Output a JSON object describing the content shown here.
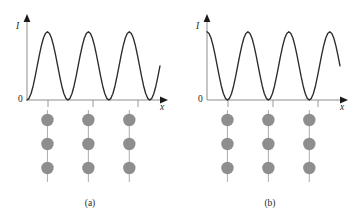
{
  "figure": {
    "caption_a": "(a)",
    "caption_b": "(b)",
    "background_color": "#ffffff",
    "curve_color": "#2b2b2b",
    "axis_color": "#8d8d8d",
    "dot_color": "#8e8e8e",
    "lattice_line_color": "#b3b3b3"
  },
  "chart_data": [
    {
      "type": "line",
      "panel": "a",
      "title": "(a)",
      "xlabel": "x",
      "ylabel": "I",
      "origin_label": "0",
      "grid": false,
      "legend": "none",
      "xlim": [
        0,
        3.25
      ],
      "ylim": [
        0,
        1.1
      ],
      "axis_tick_labels": [],
      "tick_positions_x": [
        0.5,
        1.5,
        2.5
      ],
      "description": "Intensity varies as sin-squared: zero at the atomic planes, maxima midway between them.",
      "x": [
        0,
        0.05,
        0.1,
        0.15,
        0.2,
        0.25,
        0.3,
        0.35,
        0.4,
        0.45,
        0.5,
        0.55,
        0.6,
        0.65,
        0.7,
        0.75,
        0.8,
        0.85,
        0.9,
        0.95,
        1.0,
        1.05,
        1.1,
        1.15,
        1.2,
        1.25,
        1.3,
        1.35,
        1.4,
        1.45,
        1.5,
        1.55,
        1.6,
        1.65,
        1.7,
        1.75,
        1.8,
        1.85,
        1.9,
        1.95,
        2.0,
        2.05,
        2.1,
        2.15,
        2.2,
        2.25,
        2.3,
        2.35,
        2.4,
        2.45,
        2.5,
        2.55,
        2.6,
        2.65,
        2.7,
        2.75,
        2.8,
        2.85,
        2.9,
        2.95,
        3.0,
        3.05,
        3.1,
        3.15,
        3.2,
        3.25
      ],
      "y": [
        0.0,
        0.024,
        0.095,
        0.206,
        0.345,
        0.5,
        0.655,
        0.794,
        0.905,
        0.976,
        1.0,
        0.976,
        0.905,
        0.794,
        0.655,
        0.5,
        0.345,
        0.206,
        0.095,
        0.024,
        0.0,
        0.024,
        0.095,
        0.206,
        0.345,
        0.5,
        0.655,
        0.794,
        0.905,
        0.976,
        1.0,
        0.976,
        0.905,
        0.794,
        0.655,
        0.5,
        0.345,
        0.206,
        0.095,
        0.024,
        0.0,
        0.024,
        0.095,
        0.206,
        0.345,
        0.5,
        0.655,
        0.794,
        0.905,
        0.976,
        1.0,
        0.976,
        0.905,
        0.794,
        0.655,
        0.5,
        0.345,
        0.206,
        0.095,
        0.024,
        0.0,
        0.024,
        0.095,
        0.206,
        0.345,
        0.5
      ],
      "peaks_x": [
        0.5,
        1.5,
        2.5
      ],
      "minima_x": [
        0.0,
        1.0,
        2.0,
        3.0
      ],
      "lattice": {
        "columns_x": [
          0.5,
          1.5,
          2.5
        ],
        "dots_per_column": 3,
        "total_dots": 9
      }
    },
    {
      "type": "line",
      "panel": "b",
      "title": "(b)",
      "xlabel": "x",
      "ylabel": "I",
      "origin_label": "0",
      "grid": false,
      "legend": "none",
      "xlim": [
        0,
        3.25
      ],
      "ylim": [
        0,
        1.1
      ],
      "axis_tick_labels": [],
      "tick_positions_x": [
        0.5,
        1.5,
        2.5
      ],
      "description": "Intensity varies as cos-squared: maxima at the atomic planes, zero midway between them.",
      "x": [
        0,
        0.05,
        0.1,
        0.15,
        0.2,
        0.25,
        0.3,
        0.35,
        0.4,
        0.45,
        0.5,
        0.55,
        0.6,
        0.65,
        0.7,
        0.75,
        0.8,
        0.85,
        0.9,
        0.95,
        1.0,
        1.05,
        1.1,
        1.15,
        1.2,
        1.25,
        1.3,
        1.35,
        1.4,
        1.45,
        1.5,
        1.55,
        1.6,
        1.65,
        1.7,
        1.75,
        1.8,
        1.85,
        1.9,
        1.95,
        2.0,
        2.05,
        2.1,
        2.15,
        2.2,
        2.25,
        2.3,
        2.35,
        2.4,
        2.45,
        2.5,
        2.55,
        2.6,
        2.65,
        2.7,
        2.75,
        2.8,
        2.85,
        2.9,
        2.95,
        3.0,
        3.05,
        3.1,
        3.15,
        3.2,
        3.25
      ],
      "y": [
        1.0,
        0.976,
        0.905,
        0.794,
        0.655,
        0.5,
        0.345,
        0.206,
        0.095,
        0.024,
        0.0,
        0.024,
        0.095,
        0.206,
        0.345,
        0.5,
        0.655,
        0.794,
        0.905,
        0.976,
        1.0,
        0.976,
        0.905,
        0.794,
        0.655,
        0.5,
        0.345,
        0.206,
        0.095,
        0.024,
        0.0,
        0.024,
        0.095,
        0.206,
        0.345,
        0.5,
        0.655,
        0.794,
        0.905,
        0.976,
        1.0,
        0.976,
        0.905,
        0.794,
        0.655,
        0.5,
        0.345,
        0.206,
        0.095,
        0.024,
        0.0,
        0.024,
        0.095,
        0.206,
        0.345,
        0.5,
        0.655,
        0.794,
        0.905,
        0.976,
        1.0,
        0.976,
        0.905,
        0.794,
        0.655,
        0.5
      ],
      "peaks_x": [
        0.0,
        1.0,
        2.0,
        3.0
      ],
      "minima_x": [
        0.5,
        1.5,
        2.5
      ],
      "lattice": {
        "columns_x": [
          0.5,
          1.5,
          2.5
        ],
        "dots_per_column": 3,
        "total_dots": 9
      }
    }
  ]
}
